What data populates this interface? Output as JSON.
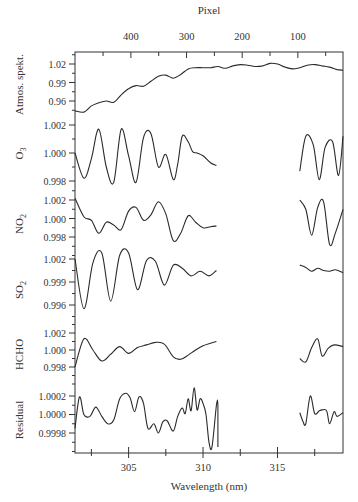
{
  "chart_data": {
    "type": "line",
    "title": "",
    "top_axis": {
      "label": "Pixel",
      "ticks": [
        400,
        300,
        200,
        100
      ]
    },
    "xlabel": "Wavelength (nm)",
    "xticks": [
      305,
      310,
      315
    ],
    "xlim": [
      301.4,
      319.4
    ],
    "gap_nm": [
      311.0,
      316.5
    ],
    "panels": [
      {
        "name": "Atmos. spekt.",
        "ylabel": "Atmos. spekt.",
        "yticks": [
          "1.02",
          "0.99",
          "0.96"
        ],
        "ylim": [
          0.94,
          1.035
        ],
        "x": [
          301.4,
          302.0,
          302.5,
          303.0,
          303.5,
          304.0,
          304.5,
          305.0,
          305.5,
          306.0,
          306.5,
          307.0,
          307.5,
          308.0,
          308.5,
          309.0,
          309.5,
          310.0,
          310.5,
          311.0,
          311.5,
          312.0,
          312.5,
          313.0,
          313.5,
          314.0,
          314.5,
          315.0,
          315.5,
          316.0,
          316.5,
          317.0,
          317.5,
          318.0,
          318.5,
          319.0,
          319.4
        ],
        "values": [
          0.944,
          0.942,
          0.952,
          0.957,
          0.96,
          0.958,
          0.97,
          0.98,
          0.985,
          0.984,
          0.992,
          1.0,
          1.002,
          0.997,
          1.003,
          1.012,
          1.014,
          1.014,
          1.014,
          1.016,
          1.013,
          1.017,
          1.019,
          1.018,
          1.016,
          1.017,
          1.021,
          1.02,
          1.015,
          1.012,
          1.014,
          1.018,
          1.019,
          1.017,
          1.015,
          1.011,
          1.01
        ]
      },
      {
        "name": "O3",
        "ylabel": "O3",
        "yticks": [
          "1.002",
          "1.000",
          "0.998"
        ],
        "ylim": [
          0.9974,
          1.0027
        ],
        "segments": [
          {
            "x": [
              301.4,
              302.0,
              302.5,
              303.0,
              303.5,
              304.0,
              304.5,
              305.0,
              305.5,
              306.0,
              306.5,
              307.0,
              307.5,
              308.0,
              308.3,
              308.6,
              309.0,
              309.3,
              309.6,
              310.0,
              310.5,
              310.9
            ],
            "values": [
              1.0,
              0.9982,
              0.9996,
              1.0017,
              0.999,
              0.9979,
              1.0017,
              0.9998,
              0.9979,
              1.0011,
              1.0014,
              0.999,
              0.9999,
              0.9981,
              0.9992,
              1.0012,
              1.0008,
              1.0001,
              1.0,
              0.9998,
              0.9993,
              0.9991
            ]
          },
          {
            "x": [
              316.5,
              316.9,
              317.4,
              317.8,
              318.2,
              318.7,
              319.1,
              319.4
            ],
            "values": [
              0.9987,
              1.0012,
              1.0006,
              0.9981,
              1.0004,
              1.0008,
              0.9984,
              1.0012
            ]
          }
        ]
      },
      {
        "name": "NO2",
        "ylabel": "NO2",
        "yticks": [
          "1.002",
          "1.000",
          "0.998"
        ],
        "ylim": [
          0.9965,
          1.0025
        ],
        "segments": [
          {
            "x": [
              301.4,
              302.0,
              302.5,
              303.0,
              303.5,
              304.0,
              304.5,
              305.0,
              305.5,
              306.0,
              306.5,
              307.0,
              307.5,
              308.0,
              308.5,
              309.0,
              309.5,
              310.0,
              310.5,
              310.9
            ],
            "values": [
              1.0022,
              1.0002,
              0.9998,
              0.9984,
              0.9996,
              0.9993,
              0.9988,
              1.0008,
              1.0012,
              0.9998,
              1.0004,
              1.0018,
              1.0005,
              0.9976,
              0.9984,
              1.0003,
              0.9996,
              0.999,
              0.9991,
              0.9992
            ]
          },
          {
            "x": [
              316.5,
              316.9,
              317.3,
              317.7,
              318.1,
              318.5,
              318.9,
              319.4
            ],
            "values": [
              1.002,
              1.001,
              0.9982,
              1.0012,
              1.0018,
              0.9972,
              0.9985,
              1.001
            ]
          }
        ]
      },
      {
        "name": "SO2",
        "ylabel": "SO2",
        "yticks": [
          "1.002",
          "0.999",
          "0.996"
        ],
        "ylim": [
          0.994,
          1.0038
        ],
        "segments": [
          {
            "x": [
              301.4,
              302.0,
              302.6,
              303.2,
              303.8,
              304.4,
              305.0,
              305.6,
              306.2,
              306.8,
              307.4,
              308.0,
              308.6,
              309.2,
              309.8,
              310.4,
              310.9
            ],
            "values": [
              1.002,
              0.9955,
              1.0015,
              1.0028,
              0.9965,
              1.0025,
              1.0028,
              0.998,
              1.0018,
              1.0017,
              0.9986,
              1.0012,
              1.0008,
              0.9998,
              1.0004,
              0.9998,
              1.0005
            ]
          },
          {
            "x": [
              316.5,
              316.9,
              317.3,
              317.7,
              318.1,
              318.5,
              318.9,
              319.4
            ],
            "values": [
              1.0012,
              1.0009,
              1.0004,
              1.0008,
              1.0005,
              1.0004,
              1.0006,
              1.0002
            ]
          }
        ]
      },
      {
        "name": "HCHO",
        "ylabel": "HCHO",
        "yticks": [
          "1.002",
          "1.000",
          "0.998"
        ],
        "ylim": [
          0.9968,
          1.003
        ],
        "segments": [
          {
            "x": [
              301.4,
              302.0,
              302.6,
              303.2,
              303.8,
              304.4,
              305.0,
              305.6,
              306.2,
              306.8,
              307.4,
              308.0,
              308.5,
              309.0,
              309.5,
              310.0,
              310.5,
              310.9
            ],
            "values": [
              0.998,
              1.0013,
              1.0,
              0.9987,
              0.9995,
              1.0004,
              0.9996,
              1.0003,
              1.0006,
              1.0009,
              1.0007,
              0.9992,
              0.9989,
              0.9994,
              1.0,
              1.0005,
              1.0008,
              1.001
            ]
          },
          {
            "x": [
              316.5,
              316.9,
              317.3,
              317.7,
              318.0,
              318.4,
              318.8,
              319.4
            ],
            "values": [
              0.999,
              0.9986,
              1.0003,
              1.0013,
              0.9993,
              1.0002,
              1.0006,
              1.0004
            ]
          }
        ]
      },
      {
        "name": "Residual",
        "ylabel": "Residual",
        "yticks": [
          "1.0002",
          "1.0000",
          "0.9998"
        ],
        "ylim": [
          0.99965,
          1.00035
        ],
        "segments": [
          {
            "x": [
              301.4,
              301.7,
              302.0,
              302.4,
              302.8,
              303.2,
              303.6,
              304.0,
              304.4,
              304.8,
              305.1,
              305.4,
              305.7,
              306.0,
              306.3,
              306.7,
              307.0,
              307.3,
              307.6,
              308.0,
              308.3,
              308.6,
              308.8,
              309.0,
              309.2,
              309.4,
              309.6,
              309.8,
              310.0,
              310.2,
              310.4,
              310.6,
              310.9,
              311.0,
              311.0
            ],
            "values": [
              0.99985,
              1.00019,
              1.0,
              0.99998,
              1.00008,
              0.99998,
              0.9999,
              0.99994,
              1.00017,
              1.00023,
              1.00018,
              1.00003,
              1.00019,
              1.00012,
              0.99985,
              0.9999,
              0.9998,
              0.99992,
              0.99993,
              0.99982,
              0.99998,
              1.00007,
              1.00001,
              1.00017,
              1.00004,
              1.00029,
              1.00005,
              1.00017,
              1.00012,
              1.0,
              0.9997,
              0.99965,
              1.0001,
              1.0001,
              0.99965
            ]
          },
          {
            "x": [
              316.5,
              316.7,
              316.9,
              317.2,
              317.5,
              317.8,
              318.0,
              318.3,
              318.5,
              318.8,
              319.0,
              319.4
            ],
            "values": [
              1.00002,
              0.99993,
              0.9999,
              1.0002,
              1.00001,
              1.00004,
              1.00005,
              1.00004,
              0.9999,
              1.00003,
              0.99998,
              1.00002
            ]
          }
        ]
      }
    ],
    "grid": false,
    "legend": "none"
  },
  "axes": {
    "top_label": "Pixel",
    "bottom_label": "Wavelength (nm)"
  }
}
